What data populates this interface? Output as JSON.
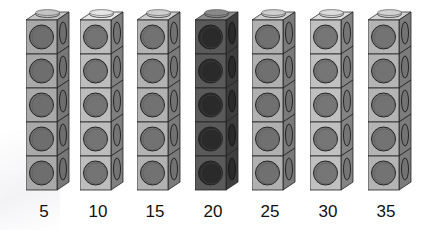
{
  "columns": [
    {
      "label": "5",
      "face": "#a9a9a9",
      "circle": "#6e6e6e",
      "side": "#777777",
      "cap": "#c4c4c4"
    },
    {
      "label": "10",
      "face": "#bdbdbd",
      "circle": "#747474",
      "side": "#808080",
      "cap": "#e6e6e6"
    },
    {
      "label": "15",
      "face": "#b2b2b2",
      "circle": "#727272",
      "side": "#7a7a7a",
      "cap": "#cfcfcf"
    },
    {
      "label": "20",
      "face": "#5a5a5a",
      "circle": "#2a2a2a",
      "side": "#3e3e3e",
      "cap": "#8a8a8a"
    },
    {
      "label": "25",
      "face": "#b0b0b0",
      "circle": "#707070",
      "side": "#7a7a7a",
      "cap": "#cdcdcd"
    },
    {
      "label": "30",
      "face": "#c0c0c0",
      "circle": "#767676",
      "side": "#848484",
      "cap": "#dcdcdc"
    },
    {
      "label": "35",
      "face": "#b4b4b4",
      "circle": "#737373",
      "side": "#7c7c7c",
      "cap": "#d2d2d2"
    }
  ],
  "cubes_per_tower": 5
}
